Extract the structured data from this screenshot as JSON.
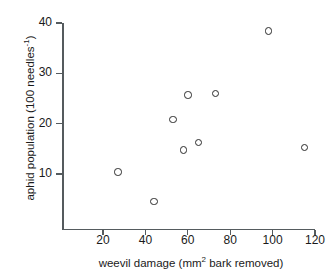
{
  "chart_data": {
    "type": "scatter",
    "title": "",
    "xlabel": "weevil damage (mm2 bark removed)",
    "xlabel_main": "weevil damage (mm",
    "xlabel_sup": "2",
    "xlabel_tail": " bark removed)",
    "ylabel": "aphid population (100 needles-1)",
    "ylabel_main": "aphid population (100 needles",
    "ylabel_sup": "-1",
    "ylabel_tail": ")",
    "xlim": [
      0,
      120
    ],
    "ylim": [
      0,
      40
    ],
    "xticks": [
      20,
      40,
      60,
      80,
      100,
      120
    ],
    "yticks": [
      10,
      20,
      30,
      40
    ],
    "xtick_labels": [
      "20",
      "40",
      "60",
      "80",
      "100",
      "120"
    ],
    "ytick_labels": [
      "10",
      "20",
      "30",
      "40"
    ],
    "grid": false,
    "legend": false,
    "marker": "open-circle",
    "marker_color": "#2b2b2b",
    "axis_color": "#555b5e",
    "background": "#ffffff",
    "x": [
      27,
      44,
      53,
      58,
      60,
      65,
      73,
      98,
      115
    ],
    "y": [
      10.4,
      4.5,
      20.8,
      14.8,
      25.7,
      16.3,
      26.0,
      38.4,
      15.3
    ],
    "points": [
      {
        "x": 27,
        "y": 10.4
      },
      {
        "x": 44,
        "y": 4.5
      },
      {
        "x": 53,
        "y": 20.8
      },
      {
        "x": 58,
        "y": 14.8
      },
      {
        "x": 60,
        "y": 25.7
      },
      {
        "x": 65,
        "y": 16.3
      },
      {
        "x": 73,
        "y": 26.0
      },
      {
        "x": 98,
        "y": 38.4
      },
      {
        "x": 115,
        "y": 15.3
      }
    ]
  }
}
